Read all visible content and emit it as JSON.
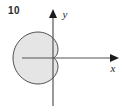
{
  "figure": {
    "number": "10",
    "background_color": "#ffffff"
  },
  "axes": {
    "x_label": "x",
    "y_label": "y",
    "axis_color": "#555555",
    "arrow_color": "#1c1c1c",
    "origin": {
      "x": 53,
      "y": 58
    },
    "x_axis_start": 22,
    "x_axis_end": 118,
    "y_axis_top": 10,
    "y_axis_bottom": 106
  },
  "chart_data": {
    "type": "line",
    "title": "",
    "xlabel": "x",
    "ylabel": "y",
    "grid": false,
    "legend": null,
    "curve_name": "cardioid",
    "polar_equation": "r = a(1 - cos(theta))",
    "fill_color": "#e5e5e5",
    "stroke_color": "#4d4d4d",
    "stroke_width": 1,
    "cusp_at_origin": true,
    "cusp_direction": "left",
    "extent_left_px": 33,
    "extent_right_px": 93,
    "extent_top_px": 30,
    "extent_bottom_px": 88,
    "a_px": 20,
    "theta_range_deg": [
      0,
      360
    ],
    "points_polar": [
      {
        "theta_deg": 0,
        "r": 0
      },
      {
        "theta_deg": 15,
        "r": 0.68
      },
      {
        "theta_deg": 30,
        "r": 2.68
      },
      {
        "theta_deg": 45,
        "r": 5.86
      },
      {
        "theta_deg": 60,
        "r": 10.0
      },
      {
        "theta_deg": 75,
        "r": 14.82
      },
      {
        "theta_deg": 90,
        "r": 20.0
      },
      {
        "theta_deg": 105,
        "r": 25.18
      },
      {
        "theta_deg": 120,
        "r": 30.0
      },
      {
        "theta_deg": 135,
        "r": 34.14
      },
      {
        "theta_deg": 150,
        "r": 37.32
      },
      {
        "theta_deg": 165,
        "r": 39.32
      },
      {
        "theta_deg": 180,
        "r": 40.0
      },
      {
        "theta_deg": 195,
        "r": 39.32
      },
      {
        "theta_deg": 210,
        "r": 37.32
      },
      {
        "theta_deg": 225,
        "r": 34.14
      },
      {
        "theta_deg": 240,
        "r": 30.0
      },
      {
        "theta_deg": 255,
        "r": 25.18
      },
      {
        "theta_deg": 270,
        "r": 20.0
      },
      {
        "theta_deg": 285,
        "r": 14.82
      },
      {
        "theta_deg": 300,
        "r": 10.0
      },
      {
        "theta_deg": 315,
        "r": 5.86
      },
      {
        "theta_deg": 330,
        "r": 2.68
      },
      {
        "theta_deg": 345,
        "r": 0.68
      },
      {
        "theta_deg": 360,
        "r": 0
      }
    ]
  }
}
